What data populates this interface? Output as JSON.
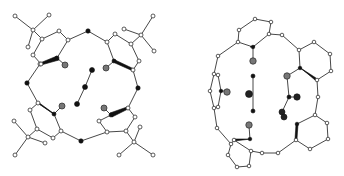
{
  "figure": {
    "panels": [
      {
        "id": "left",
        "label": "Macrocycle with four tert-butyl substituted aryl rings and a central linear guest",
        "colors": {
          "open_atom": "#ffffff",
          "black_atom": "#111111",
          "grey_atom": "#777777",
          "bond": "#333333"
        }
      },
      {
        "id": "right",
        "label": "Macrocycle with four aryl rings enclosing two guest fragments",
        "colors": {
          "open_atom": "#ffffff",
          "black_atom": "#111111",
          "grey_atom": "#777777",
          "bond": "#333333"
        }
      }
    ]
  }
}
